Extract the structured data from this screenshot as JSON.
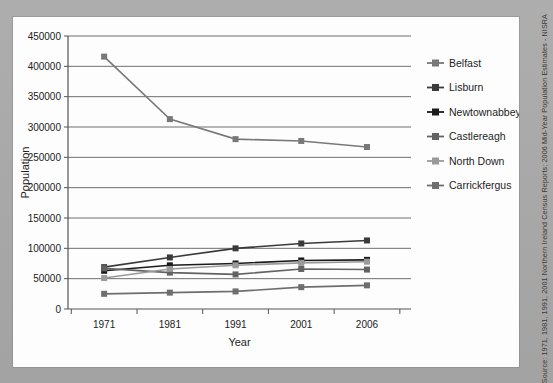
{
  "page": {
    "background_color": "#a9a9a9",
    "panel_color": "#fdfdfd"
  },
  "source_note": "Source: 1971, 1981, 1991, 2001 Northern Ireland Census Reports; 2006 Mid-Year Population Estimates - NISRA",
  "title_fragment": "",
  "chart_data": {
    "type": "line",
    "title": "",
    "xlabel": "Year",
    "ylabel": "Population",
    "categories": [
      "1971",
      "1981",
      "1991",
      "2001",
      "2006"
    ],
    "x": [
      1971,
      1981,
      1991,
      2001,
      2006
    ],
    "ylim": [
      0,
      450000
    ],
    "yticks": [
      0,
      50000,
      100000,
      150000,
      200000,
      250000,
      300000,
      350000,
      400000,
      450000
    ],
    "ytick_labels": [
      "0",
      "50000",
      "100000",
      "150000",
      "200000",
      "250000",
      "300000",
      "350000",
      "400000",
      "450000"
    ],
    "grid": true,
    "legend_position": "right",
    "series": [
      {
        "name": "Belfast",
        "color": "#787878",
        "values": [
          416000,
          313000,
          280000,
          277000,
          267000
        ]
      },
      {
        "name": "Lisburn",
        "color": "#3a3a3a",
        "values": [
          69000,
          85000,
          100000,
          108000,
          113000
        ]
      },
      {
        "name": "Newtownabbey",
        "color": "#1b1b1b",
        "values": [
          63000,
          72000,
          75000,
          80000,
          81000
        ]
      },
      {
        "name": "Castlereagh",
        "color": "#636363",
        "values": [
          67000,
          60000,
          57000,
          66000,
          65000
        ]
      },
      {
        "name": "North Down",
        "color": "#9a9a9a",
        "values": [
          51000,
          66000,
          72000,
          76000,
          78000
        ]
      },
      {
        "name": "Carrickfergus",
        "color": "#6e6e6e",
        "values": [
          25000,
          27000,
          29000,
          36000,
          39000
        ]
      }
    ]
  }
}
